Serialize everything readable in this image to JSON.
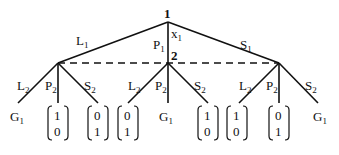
{
  "diagram": {
    "type": "extensive-form game tree",
    "root": {
      "label": "1",
      "info_label": "x",
      "info_sub": "1"
    },
    "second_player": {
      "label": "2"
    },
    "first_moves": [
      {
        "label": "L",
        "sub": "1"
      },
      {
        "label": "P",
        "sub": "1"
      },
      {
        "label": "S",
        "sub": "1"
      }
    ],
    "second_moves": {
      "L": "L",
      "P": "P",
      "S": "S",
      "sub": "2"
    },
    "subtrees": [
      {
        "parent_move": "L1",
        "leaves": [
          {
            "kind": "game",
            "label": "G",
            "sub": "1"
          },
          {
            "kind": "payoff",
            "top": "1",
            "bottom": "0"
          },
          {
            "kind": "payoff",
            "top": "0",
            "bottom": "1"
          }
        ]
      },
      {
        "parent_move": "P1",
        "leaves": [
          {
            "kind": "payoff",
            "top": "0",
            "bottom": "1"
          },
          {
            "kind": "game",
            "label": "G",
            "sub": "1"
          },
          {
            "kind": "payoff",
            "top": "1",
            "bottom": "0"
          }
        ]
      },
      {
        "parent_move": "S1",
        "leaves": [
          {
            "kind": "payoff",
            "top": "1",
            "bottom": "0"
          },
          {
            "kind": "payoff",
            "top": "0",
            "bottom": "1"
          },
          {
            "kind": "game",
            "label": "G",
            "sub": "1"
          }
        ]
      }
    ]
  }
}
